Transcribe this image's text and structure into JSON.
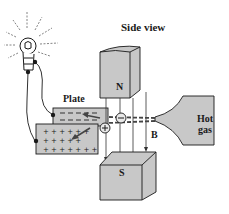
{
  "figure": {
    "title": "Side view",
    "labels": {
      "plate": "Plate",
      "north_pole": "N",
      "south_pole": "S",
      "magnetic_field": "B",
      "hot_gas_line1": "Hot",
      "hot_gas_line2": "gas"
    },
    "symbols": {
      "negative_ion": "−",
      "positive_ion": "+",
      "upper_plate_charge": "negative",
      "lower_plate_charge": "positive"
    },
    "components": [
      "light bulb",
      "upper plate (negative)",
      "lower plate (positive)",
      "north magnet pole",
      "south magnet pole",
      "hot gas source",
      "ion stream",
      "magnetic field lines B"
    ],
    "colors": {
      "fill_gray": "#c8c8c8",
      "line": "#1a1a1a",
      "background": "#ffffff"
    }
  }
}
